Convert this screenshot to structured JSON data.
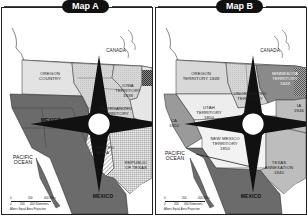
{
  "maps": [
    {
      "title": "Map A",
      "labels": {
        "canada": "CANADA",
        "oregon": "OREGON COUNTRY",
        "iowa": "IOWA TERRITORY 1838",
        "unorganized": "UNORGANIZED TERRITORY",
        "mexico_north": "MEXICO",
        "mexico_south": "MEXICO",
        "disputed": "DISPUTED AREA",
        "texas": "REPUBLIC OF TEXAS",
        "ocean": "PACIFIC OCEAN"
      },
      "scale": {
        "miles": [
          "0",
          "200",
          "400 Miles"
        ],
        "km": [
          "0",
          "200",
          "400 Kilometers"
        ],
        "projection": "Albers Equal-Area Projection"
      },
      "compass": [
        "N",
        "E",
        "S",
        "W"
      ]
    },
    {
      "title": "Map B",
      "labels": {
        "canada": "CANADA",
        "oregon": "OREGON TERRITORY 1848",
        "minnesota": "MINNESOTA TERRITORY 1849",
        "iowa": "IA 1846",
        "unorganized": "UNORGANIZED TERRITORY",
        "utah": "UTAH TERRITORY 1850",
        "newmexico": "NEW MEXICO TERRITORY 1850",
        "california": "CA 1850",
        "texas": "TEXAS ANNEXATION 1845",
        "mexico": "MEXICO",
        "ocean": "PACIFIC OCEAN"
      },
      "scale": {
        "miles": [
          "0",
          "200",
          "400 Miles"
        ],
        "km": [
          "0",
          "200",
          "400 Kilometers"
        ],
        "projection": "Albers Equal-Area Projection"
      },
      "compass": [
        "N",
        "E",
        "S",
        "W"
      ]
    }
  ],
  "colors": {
    "mexico": "#6b6b6b",
    "us_light": "#d9d9d9",
    "oregon": "#ececec",
    "texas_b": "#bdbdbd",
    "minnesota": "#8a8a8a",
    "california": "#9a9a9a",
    "border": "#222222"
  }
}
